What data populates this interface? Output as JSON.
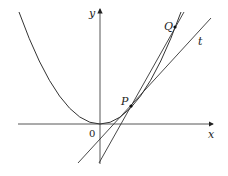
{
  "diagram": {
    "labels": {
      "x_axis": "x",
      "y_axis": "y",
      "origin": "0",
      "point_p": "P",
      "point_q": "Q",
      "tangent": "t"
    },
    "colors": {
      "stroke": "#333333",
      "background": "#ffffff"
    },
    "elements": [
      "parabola y = x^2",
      "tangent line t at P",
      "secant line PQ"
    ]
  }
}
